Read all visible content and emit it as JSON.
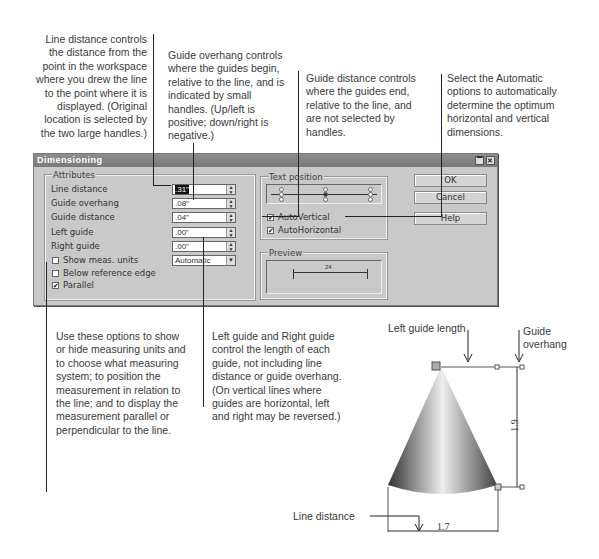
{
  "callouts": {
    "line_distance": "Line distance controls the distance from the point in the workspace where you drew the line to the point where it is displayed. (Original location is selected by the two large handles.)",
    "guide_overhang": "Guide overhang controls where the guides begin, relative to the line, and is indicated by small handles. (Up/left is positive; down/right is negative.)",
    "guide_distance": "Guide distance controls where the guides end, relative to the line, and are not selected by handles.",
    "automatic": "Select the Automatic options to automatically determine the optimum horizontal and vertical dimensions.",
    "show_units": "Use these options to show or hide measuring units and to choose what measuring system; to position the measurement in relation to the line; and to display the measurement parallel or perpendicular to the line.",
    "left_right_guide": "Left guide and Right guide control the length of each guide, not including line distance or guide overhang. (On vertical lines where guides are horizontal, left and right may be reversed.)"
  },
  "dialog": {
    "title": "Dimensioning",
    "attributes": {
      "label": "Attributes",
      "fields": [
        {
          "label": "Line distance",
          "value": ".31\""
        },
        {
          "label": "Guide overhang",
          "value": ".08\""
        },
        {
          "label": "Guide distance",
          "value": ".04\""
        },
        {
          "label": "Left guide",
          "value": ".00\""
        },
        {
          "label": "Right guide",
          "value": ".00\""
        }
      ],
      "show_units": {
        "label": "Show meas. units",
        "checked": false,
        "select": "Automatic"
      },
      "below_reference": {
        "label": "Below reference edge",
        "checked": false
      },
      "parallel": {
        "label": "Parallel",
        "checked": true
      }
    },
    "text_position": {
      "label": "Text position",
      "auto_vertical": {
        "label": "AutoVertical",
        "checked": true
      },
      "auto_horizontal": {
        "label": "AutoHorizontal",
        "checked": true
      }
    },
    "preview": {
      "label": "Preview",
      "value": "24"
    },
    "buttons": {
      "ok": "OK",
      "cancel": "Cancel",
      "help": "Help"
    }
  },
  "figure": {
    "left_guide_length": "Left guide length",
    "guide_overhang": "Guide overhang",
    "line_distance": "Line distance",
    "height_value": "1.9",
    "width_value": "1.7"
  }
}
